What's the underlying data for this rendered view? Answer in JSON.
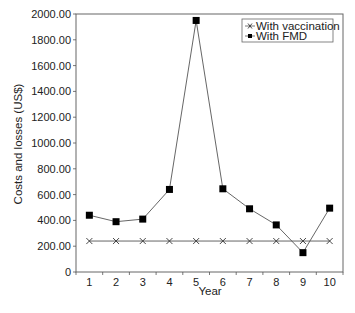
{
  "chart_data": {
    "type": "line",
    "title": "",
    "xlabel": "Year",
    "ylabel": "Costs and losses (US$)",
    "categories": [
      "1",
      "2",
      "3",
      "4",
      "5",
      "6",
      "7",
      "8",
      "9",
      "10"
    ],
    "x": [
      1,
      2,
      3,
      4,
      5,
      6,
      7,
      8,
      9,
      10
    ],
    "ylim": [
      0,
      2000
    ],
    "yticks": [
      0,
      200,
      400,
      600,
      800,
      1000,
      1200,
      1400,
      1600,
      1800,
      2000
    ],
    "ytick_labels": [
      "0",
      "200.00",
      "400.00",
      "600.00",
      "800.00",
      "1000.00",
      "1200.00",
      "1400.00",
      "1600.00",
      "1800.00",
      "2000.00"
    ],
    "grid": false,
    "legend_position": "top-right (inside plot)",
    "series": [
      {
        "name": "With vaccination",
        "marker": "x",
        "color": "#333333",
        "values": [
          240,
          240,
          240,
          240,
          240,
          240,
          240,
          240,
          240,
          240
        ]
      },
      {
        "name": "With FMD",
        "marker": "square",
        "color": "#111111",
        "values": [
          440,
          390,
          410,
          640,
          1950,
          645,
          490,
          365,
          150,
          495
        ]
      }
    ]
  },
  "legend": {
    "items": [
      {
        "label": "With vaccination",
        "marker": "x-icon"
      },
      {
        "label": "With FMD",
        "marker": "square-icon"
      }
    ]
  },
  "axes": {
    "x_title": "Year",
    "y_title": "Costs and losses (US$)"
  },
  "colors": {
    "axis": "#555555",
    "frame": "#666666",
    "line": "#555555",
    "marker_fill": "#000000",
    "text": "#222222"
  }
}
